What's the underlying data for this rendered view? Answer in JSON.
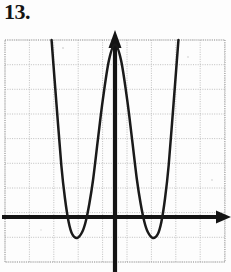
{
  "page": {
    "problem_number": "13.",
    "background_color": "#fdfdfd"
  },
  "graph": {
    "ink_color": "#1a1a1a",
    "axis_color": "#141414",
    "grid_color": "#b9b9b9",
    "x_axis_label": "",
    "y_axis_label": "",
    "has_arrowheads": true,
    "arrow_directions": [
      "up",
      "right"
    ]
  },
  "chart_data": {
    "type": "line",
    "title": "",
    "xlabel": "",
    "ylabel": "",
    "grid": true,
    "legend": null,
    "xlim": [
      -4.5,
      4.5
    ],
    "ylim": [
      -2.0,
      7.5
    ],
    "x_tick_step": 1,
    "y_tick_step": 1,
    "tick_labels_shown": false,
    "degree": 4,
    "leading_coefficient_sign": "positive",
    "y_intercept": 7,
    "local_maximum": {
      "x": 0,
      "y": 7
    },
    "local_minima": [
      {
        "x": -1.55,
        "y": -0.85
      },
      {
        "x": 1.55,
        "y": -0.85
      }
    ],
    "x_intercepts": [
      -2.0,
      -0.95,
      0.95,
      2.0
    ],
    "series": [
      {
        "name": "f(x)",
        "x": [
          -2.6,
          -2.4,
          -2.2,
          -2.05,
          -1.9,
          -1.75,
          -1.55,
          -1.35,
          -1.2,
          -1.05,
          -0.9,
          -0.7,
          -0.5,
          -0.25,
          0.0,
          0.25,
          0.5,
          0.7,
          0.9,
          1.05,
          1.2,
          1.35,
          1.55,
          1.75,
          1.9,
          2.05,
          2.2,
          2.4,
          2.6
        ],
        "y": [
          7.9,
          4.6,
          2.1,
          0.75,
          -0.2,
          -0.7,
          -0.85,
          -0.62,
          -0.18,
          0.55,
          1.5,
          3.15,
          4.75,
          6.35,
          7.0,
          6.35,
          4.75,
          3.15,
          1.5,
          0.55,
          -0.18,
          -0.62,
          -0.85,
          -0.7,
          -0.2,
          0.75,
          2.1,
          4.6,
          7.9
        ]
      }
    ]
  }
}
